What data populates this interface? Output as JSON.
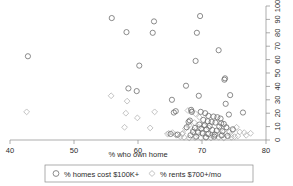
{
  "chart_data": {
    "type": "scatter",
    "title": "",
    "xlabel": "% who own home",
    "ylabel": "",
    "xlim": [
      40,
      80
    ],
    "ylim": [
      0,
      100
    ],
    "xticks": [
      40,
      50,
      60,
      70,
      80
    ],
    "yticks": [
      0,
      10,
      20,
      30,
      40,
      50,
      60,
      70,
      80,
      90,
      100
    ],
    "yaxis_position": "right",
    "yaxis_label_rotation": 90,
    "grid": false,
    "legend_position": "bottom",
    "series": [
      {
        "name": "% homes cost $100K+",
        "marker": "circle",
        "color": "#6f6f6f",
        "points": [
          [
            42.8,
            62.5
          ],
          [
            55.9,
            91.0
          ],
          [
            58.2,
            80.5
          ],
          [
            62.5,
            88.5
          ],
          [
            62.3,
            80.0
          ],
          [
            60.2,
            55.5
          ],
          [
            69.7,
            92.5
          ],
          [
            69.2,
            80.0
          ],
          [
            72.6,
            67.0
          ],
          [
            69.0,
            59.0
          ],
          [
            73.6,
            46.0
          ],
          [
            73.5,
            45.0
          ],
          [
            58.5,
            38.5
          ],
          [
            59.8,
            36.5
          ],
          [
            67.5,
            40.5
          ],
          [
            69.5,
            33.0
          ],
          [
            74.4,
            33.5
          ],
          [
            65.3,
            30.0
          ],
          [
            68.3,
            22.5
          ],
          [
            68.4,
            21.0
          ],
          [
            73.7,
            27.0
          ],
          [
            65.6,
            20.5
          ],
          [
            65.9,
            21.5
          ],
          [
            69.8,
            21.0
          ],
          [
            70.5,
            20.0
          ],
          [
            74.2,
            19.0
          ],
          [
            76.4,
            20.5
          ],
          [
            71.0,
            18.0
          ],
          [
            71.8,
            17.5
          ],
          [
            72.4,
            17.0
          ],
          [
            72.9,
            16.0
          ],
          [
            70.2,
            15.0
          ],
          [
            70.9,
            14.0
          ],
          [
            71.5,
            13.5
          ],
          [
            72.1,
            13.0
          ],
          [
            73.0,
            12.5
          ],
          [
            73.4,
            12.0
          ],
          [
            69.6,
            11.5
          ],
          [
            70.4,
            11.0
          ],
          [
            71.2,
            10.5
          ],
          [
            72.7,
            10.0
          ],
          [
            73.8,
            9.5
          ],
          [
            68.9,
            9.0
          ],
          [
            69.9,
            8.5
          ],
          [
            70.7,
            8.0
          ],
          [
            71.6,
            7.5
          ],
          [
            72.3,
            7.0
          ],
          [
            73.2,
            6.5
          ],
          [
            68.6,
            6.0
          ],
          [
            69.4,
            5.5
          ],
          [
            70.1,
            5.0
          ],
          [
            71.0,
            4.5
          ],
          [
            72.0,
            4.0
          ],
          [
            73.1,
            3.5
          ],
          [
            74.0,
            3.0
          ],
          [
            68.2,
            3.5
          ],
          [
            69.1,
            2.5
          ],
          [
            70.6,
            2.0
          ],
          [
            71.9,
            2.5
          ],
          [
            67.9,
            13.5
          ],
          [
            68.1,
            14.5
          ],
          [
            67.6,
            9.5
          ],
          [
            66.2,
            4.0
          ],
          [
            65.1,
            4.5
          ],
          [
            74.8,
            8.0
          ]
        ]
      },
      {
        "name": "% rents $700+/mo",
        "marker": "diamond",
        "color": "#b4b4b4",
        "points": [
          [
            42.6,
            21.0
          ],
          [
            55.8,
            33.0
          ],
          [
            58.3,
            29.0
          ],
          [
            58.1,
            20.0
          ],
          [
            59.9,
            16.5
          ],
          [
            57.9,
            9.5
          ],
          [
            61.9,
            9.0
          ],
          [
            62.6,
            21.0
          ],
          [
            64.8,
            5.0
          ],
          [
            65.4,
            5.5
          ],
          [
            64.6,
            4.5
          ],
          [
            66.0,
            3.5
          ],
          [
            67.0,
            5.0
          ],
          [
            67.8,
            22.0
          ],
          [
            68.4,
            21.5
          ],
          [
            69.0,
            19.5
          ],
          [
            69.6,
            17.0
          ],
          [
            68.8,
            13.0
          ],
          [
            68.0,
            11.0
          ],
          [
            67.4,
            8.5
          ],
          [
            68.6,
            7.5
          ],
          [
            69.3,
            6.5
          ],
          [
            70.0,
            5.5
          ],
          [
            70.8,
            4.5
          ],
          [
            71.5,
            3.5
          ],
          [
            72.2,
            4.0
          ],
          [
            73.0,
            3.0
          ],
          [
            73.7,
            4.5
          ],
          [
            74.3,
            6.0
          ],
          [
            74.9,
            7.5
          ],
          [
            75.4,
            9.5
          ],
          [
            75.9,
            6.0
          ],
          [
            76.6,
            5.5
          ],
          [
            77.6,
            5.0
          ],
          [
            66.6,
            2.5
          ],
          [
            67.2,
            2.0
          ],
          [
            68.0,
            1.5
          ],
          [
            68.9,
            1.8
          ],
          [
            69.8,
            1.5
          ],
          [
            70.7,
            2.0
          ],
          [
            71.4,
            1.5
          ],
          [
            72.6,
            2.0
          ],
          [
            73.4,
            1.5
          ],
          [
            74.6,
            2.0
          ],
          [
            75.1,
            2.5
          ],
          [
            69.5,
            9.5
          ],
          [
            70.3,
            10.5
          ],
          [
            71.1,
            9.0
          ],
          [
            66.9,
            4.5
          ],
          [
            65.9,
            4.0
          ],
          [
            72.9,
            8.0
          ],
          [
            73.9,
            9.0
          ],
          [
            74.5,
            4.0
          ],
          [
            75.6,
            3.0
          ],
          [
            76.9,
            3.5
          ]
        ]
      }
    ]
  },
  "axes": {
    "x_tick_labels": [
      "40",
      "50",
      "60",
      "70",
      "80"
    ],
    "y_tick_labels": [
      "0",
      "10",
      "20",
      "30",
      "40",
      "50",
      "60",
      "70",
      "80",
      "90",
      "100"
    ],
    "x_axis_title": "% who own home"
  },
  "legend": {
    "entries": [
      {
        "label": "% homes cost $100K+",
        "marker": "circle-marker"
      },
      {
        "label": "% rents $700+/mo",
        "marker": "diamond-marker"
      }
    ]
  },
  "colors": {
    "circle_series": "#6f6f6f",
    "diamond_series": "#b4b4b4",
    "axis": "#8a8a8a",
    "text": "#2b2b2b",
    "background": "#ffffff"
  }
}
